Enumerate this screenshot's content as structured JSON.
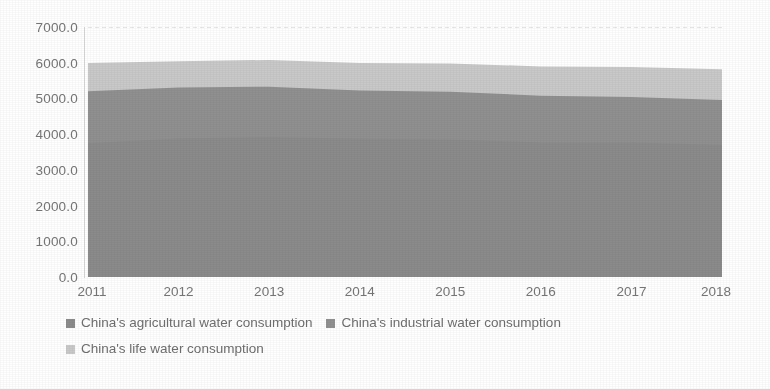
{
  "chart_data": {
    "type": "area",
    "stacked": true,
    "title": "",
    "subtitle": "",
    "xlabel": "",
    "ylabel": "",
    "categories": [
      "2011",
      "2012",
      "2013",
      "2014",
      "2015",
      "2016",
      "2017",
      "2018"
    ],
    "x": [
      2011,
      2012,
      2013,
      2014,
      2015,
      2016,
      2017,
      2018
    ],
    "ylim": [
      0.0,
      7000.0
    ],
    "ytick_labels": [
      "0.0",
      "1000.0",
      "2000.0",
      "3000.0",
      "4000.0",
      "5000.0",
      "6000.0",
      "7000.0"
    ],
    "ytick_values": [
      0,
      1000,
      2000,
      3000,
      4000,
      5000,
      6000,
      7000
    ],
    "ytick_step": 1000,
    "grid": "horizontal-top-only",
    "legend_position": "bottom-left",
    "series": [
      {
        "name": "China's agricultural water consumption",
        "color": "#8b8b8b",
        "values": [
          3743.0,
          3880.0,
          3922.0,
          3869.0,
          3852.0,
          3768.0,
          3766.0,
          3693.0
        ]
      },
      {
        "name": "China's industrial water consumption",
        "color": "#909090",
        "values": [
          1461.0,
          1423.0,
          1406.0,
          1356.0,
          1335.0,
          1308.0,
          1277.0,
          1262.0
        ]
      },
      {
        "name": "China's life water consumption",
        "color": "#c9c9c9",
        "values": [
          789.0,
          740.0,
          750.0,
          767.0,
          793.0,
          821.0,
          838.0,
          860.0
        ]
      }
    ],
    "stack_tops": {
      "agricultural": [
        3743.0,
        3880.0,
        3922.0,
        3869.0,
        3852.0,
        3768.0,
        3766.0,
        3693.0
      ],
      "agricultural_plus_industrial": [
        5204.0,
        5303.0,
        5328.0,
        5225.0,
        5187.0,
        5076.0,
        5043.0,
        4955.0
      ],
      "total": [
        5993.0,
        6043.0,
        6078.0,
        5992.0,
        5980.0,
        5897.0,
        5881.0,
        5815.0
      ]
    },
    "colors": {
      "agricultural": "#8b8b8b",
      "industrial": "#909090",
      "life": "#c9c9c9",
      "axis": "#d9d9d9",
      "text": "#767676",
      "gridline": "#e2e2e2",
      "background": "#ffffff"
    }
  },
  "legend": {
    "rows": [
      [
        {
          "label": "China's agricultural water consumption",
          "swatch": "#8b8b8b",
          "marker": "square-marker"
        },
        {
          "label": "China's industrial water consumption",
          "swatch": "#909090",
          "marker": "square-marker"
        }
      ],
      [
        {
          "label": "China's life water consumption",
          "swatch": "#c9c9c9",
          "marker": "square-marker"
        }
      ]
    ]
  }
}
